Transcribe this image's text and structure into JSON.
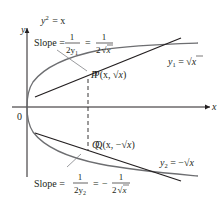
{
  "figure": {
    "type": "diagram",
    "equation_label": {
      "lhs": "y",
      "exp": "2",
      "rhs": "= x"
    },
    "axes": {
      "x_label": "x",
      "y_label": "y",
      "origin_label": "0"
    },
    "points": [
      {
        "id": "P",
        "label_prefix": "P(x, ",
        "label_root": "x",
        "label_suffix": ")"
      },
      {
        "id": "Q",
        "label_prefix": "Q(x, −",
        "label_root": "x",
        "label_suffix": ")"
      }
    ],
    "branches": [
      {
        "id": "upper",
        "label_var": "y",
        "label_sub": "1",
        "label_eq": " = ",
        "label_root": "x"
      },
      {
        "id": "lower",
        "label_var": "y",
        "label_sub": "2",
        "label_eq": " = −",
        "label_root": "x"
      }
    ],
    "slope_labels": [
      {
        "id": "upper",
        "word": "Slope =",
        "frac1_num": "1",
        "frac1_den_pre": "2y",
        "frac1_den_sub": "1",
        "eq": "=",
        "sign": "",
        "frac2_num": "1",
        "frac2_den_pre": "2",
        "frac2_den_root": "x"
      },
      {
        "id": "lower",
        "word": "Slope =",
        "frac1_num": "1",
        "frac1_den_pre": "2y",
        "frac1_den_sub": "2",
        "eq": "=",
        "sign": "−",
        "frac2_num": "1",
        "frac2_den_pre": "2",
        "frac2_den_root": "x"
      }
    ],
    "colors": {
      "ink": "#231f20",
      "curve": "#6d6e71",
      "tangent": "#231f20",
      "leader": "#808285"
    }
  }
}
